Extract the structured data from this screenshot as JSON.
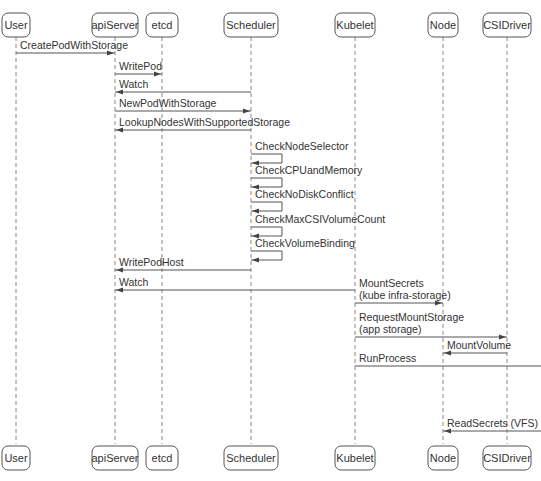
{
  "diagram": {
    "type": "sequence",
    "actors": [
      {
        "id": "user",
        "label": "User"
      },
      {
        "id": "apiServer",
        "label": "apiServer"
      },
      {
        "id": "etcd",
        "label": "etcd"
      },
      {
        "id": "scheduler",
        "label": "Scheduler"
      },
      {
        "id": "kubelet",
        "label": "Kubelet"
      },
      {
        "id": "node",
        "label": "Node"
      },
      {
        "id": "csidriver",
        "label": "CSIDriver"
      }
    ],
    "messages": [
      {
        "from": "user",
        "to": "apiServer",
        "lines": [
          "CreatePodWithStorage"
        ]
      },
      {
        "from": "apiServer",
        "to": "etcd",
        "lines": [
          "WritePod"
        ]
      },
      {
        "from": "scheduler",
        "to": "apiServer",
        "lines": [
          "Watch"
        ]
      },
      {
        "from": "apiServer",
        "to": "scheduler",
        "lines": [
          "NewPodWithStorage"
        ]
      },
      {
        "from": "scheduler",
        "to": "apiServer",
        "lines": [
          "LookupNodesWithSupportedStorage"
        ]
      },
      {
        "from": "scheduler",
        "to": "scheduler",
        "lines": [
          "CheckNodeSelector"
        ]
      },
      {
        "from": "scheduler",
        "to": "scheduler",
        "lines": [
          "CheckCPUandMemory"
        ]
      },
      {
        "from": "scheduler",
        "to": "scheduler",
        "lines": [
          "CheckNoDiskConflict"
        ]
      },
      {
        "from": "scheduler",
        "to": "scheduler",
        "lines": [
          "CheckMaxCSIVolumeCount"
        ]
      },
      {
        "from": "scheduler",
        "to": "scheduler",
        "lines": [
          "CheckVolumeBinding"
        ]
      },
      {
        "from": "scheduler",
        "to": "apiServer",
        "lines": [
          "WritePodHost"
        ]
      },
      {
        "from": "kubelet",
        "to": "apiServer",
        "lines": [
          "Watch"
        ]
      },
      {
        "from": "kubelet",
        "to": "node",
        "lines": [
          "MountSecrets",
          "(kube infra-storage)"
        ]
      },
      {
        "from": "kubelet",
        "to": "csidriver",
        "lines": [
          "RequestMountStorage",
          "(app storage)"
        ]
      },
      {
        "from": "csidriver",
        "to": "node",
        "lines": [
          "MountVolume"
        ]
      },
      {
        "from": "kubelet",
        "to": "offscreen-right",
        "lines": [
          "RunProcess"
        ]
      },
      {
        "from": "offscreen-right",
        "to": "node",
        "lines": [
          "ReadSecrets (VFS)"
        ]
      }
    ]
  }
}
